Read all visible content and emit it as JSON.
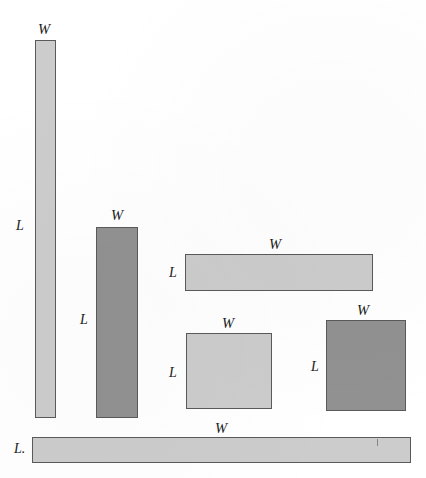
{
  "figure": {
    "background_color": "#ffffff",
    "outline_color": "#5a5a5a",
    "fill_light": "#cccccc",
    "fill_dark": "#919191",
    "label_width": "W",
    "label_length": "L",
    "label_length_bottom": "L."
  },
  "rectangles": [
    {
      "id": "rect-1",
      "shade": "light",
      "x": 35,
      "y": 40,
      "width": 21,
      "height": 378,
      "width_label": "W",
      "length_label": "L",
      "width_label_x": 38,
      "width_label_y": 22,
      "length_label_x": 16,
      "length_label_y": 219
    },
    {
      "id": "rect-2",
      "shade": "dark",
      "x": 96,
      "y": 227,
      "width": 42,
      "height": 191,
      "width_label": "W",
      "length_label": "L",
      "width_label_x": 111,
      "width_label_y": 208,
      "length_label_x": 80,
      "length_label_y": 313
    },
    {
      "id": "rect-3",
      "shade": "light",
      "x": 185,
      "y": 254,
      "width": 188,
      "height": 37,
      "width_label": "W",
      "length_label": "L",
      "width_label_x": 269,
      "width_label_y": 237,
      "length_label_x": 169,
      "length_label_y": 266
    },
    {
      "id": "rect-4",
      "shade": "light",
      "x": 186,
      "y": 333,
      "width": 86,
      "height": 76,
      "width_label": "W",
      "length_label": "L",
      "width_label_x": 222,
      "width_label_y": 316,
      "length_label_x": 169,
      "length_label_y": 366
    },
    {
      "id": "rect-5",
      "shade": "dark",
      "x": 326,
      "y": 320,
      "width": 80,
      "height": 91,
      "width_label": "W",
      "length_label": "L",
      "width_label_x": 357,
      "width_label_y": 303,
      "length_label_x": 311,
      "length_label_y": 360
    },
    {
      "id": "rect-6",
      "shade": "light",
      "x": 32,
      "y": 437,
      "width": 379,
      "height": 26,
      "width_label": "W",
      "length_label": "L.",
      "width_label_x": 215,
      "width_label_y": 421,
      "length_label_x": 14,
      "length_label_y": 442
    }
  ]
}
